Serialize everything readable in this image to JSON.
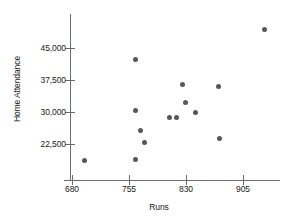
{
  "chart_data": {
    "type": "scatter",
    "title": "",
    "xlabel": "Runs",
    "ylabel": "Home Attendance",
    "xlim": [
      665,
      940
    ],
    "ylim": [
      16500,
      49500
    ],
    "xticks": [
      680,
      755,
      830,
      905
    ],
    "xtick_labels": [
      "680",
      "755",
      "830",
      "905"
    ],
    "yticks": [
      22500,
      30000,
      37500,
      45000
    ],
    "ytick_labels": [
      "22,500",
      "30,000",
      "37,500",
      "45,000"
    ],
    "grid": false,
    "legend": false,
    "marker_color": "#575757",
    "axis_color": "#6d6d6d",
    "points": [
      {
        "x": 697,
        "y": 18600
      },
      {
        "x": 763,
        "y": 18800
      },
      {
        "x": 763,
        "y": 42300
      },
      {
        "x": 763,
        "y": 30400
      },
      {
        "x": 770,
        "y": 25700
      },
      {
        "x": 775,
        "y": 22900
      },
      {
        "x": 808,
        "y": 28600
      },
      {
        "x": 818,
        "y": 28800
      },
      {
        "x": 826,
        "y": 36500
      },
      {
        "x": 829,
        "y": 32200
      },
      {
        "x": 842,
        "y": 29900
      },
      {
        "x": 873,
        "y": 36000
      },
      {
        "x": 874,
        "y": 23800
      },
      {
        "x": 933,
        "y": 49300
      }
    ]
  }
}
